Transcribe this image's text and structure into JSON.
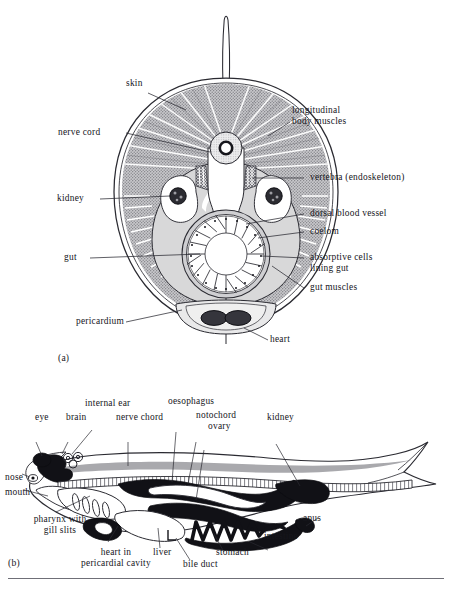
{
  "figure": {
    "panels": [
      {
        "tag": "(a)",
        "caption_role": "cross-section of a fish body"
      },
      {
        "tag": "(b)",
        "caption_role": "longitudinal section of a fish"
      }
    ]
  },
  "panel_a": {
    "tag": "(a)",
    "labels": {
      "skin": "skin",
      "longitudinal_body_muscles": "longitudinal\nbody muscles",
      "nerve_cord": "nerve cord",
      "vertebra": "vertebra (endoskeleton)",
      "kidney": "kidney",
      "dorsal_blood_vessel": "dorsal blood vessel",
      "coelom": "coelom",
      "gut": "gut",
      "absorptive_cells": "absorptive cells\nlining gut",
      "gut_muscles": "gut muscles",
      "pericardium": "pericardium",
      "heart": "heart"
    }
  },
  "panel_b": {
    "tag": "(b)",
    "labels": {
      "eye": "eye",
      "brain": "brain",
      "internal_ear": "internal ear",
      "nerve_chord": "nerve chord",
      "oesophagus": "oesophagus",
      "notochord": "notochord",
      "ovary": "ovary",
      "kidney": "kidney",
      "nose": "nose",
      "mouth": "mouth",
      "pharynx_with_gill_slits": "pharynx with\ngill slits",
      "heart_in_pericardial_cavity": "heart in\npericardial cavity",
      "liver": "liver",
      "bile_duct": "bile duct",
      "stomach": "stomach",
      "intestine": "intestine",
      "anus": "anus"
    }
  },
  "colors": {
    "ink": "#16161c",
    "line": "#2a2a31",
    "muscle_fill": "#b9b9bc",
    "coelom_fill": "#d8d8d9",
    "organ_dark": "#111116",
    "nerve_gray": "#a9a9ad",
    "rule": "#6f6f77",
    "paper": "#ffffff"
  }
}
